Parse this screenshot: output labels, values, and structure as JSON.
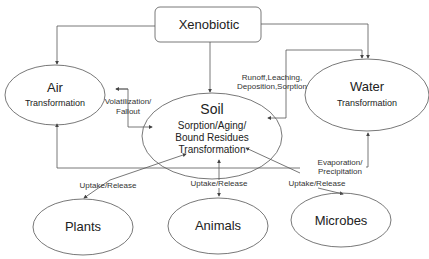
{
  "nodes": {
    "xenobiotic": {
      "label": "Xenobiotic"
    },
    "air": {
      "title": "Air",
      "subtitle": "Transformation"
    },
    "soil": {
      "title": "Soil",
      "line1": "Sorption/Aging/",
      "line2": "Bound Residues",
      "line3": "Transformation"
    },
    "water": {
      "title": "Water",
      "subtitle": "Transformation"
    },
    "plants": {
      "label": "Plants"
    },
    "animals": {
      "label": "Animals"
    },
    "microbes": {
      "label": "Microbes"
    }
  },
  "edges": {
    "volatilization": {
      "line1": "Volatilization/",
      "line2": "Fallout"
    },
    "runoff": {
      "line1": "Runoff,Leaching,",
      "line2": "Deposition,Sorption"
    },
    "evaporation": {
      "line1": "Evaporation/",
      "line2": "Precipitation"
    },
    "uptake_plants": "Uptake/Release",
    "uptake_animals": "Uptake/Release",
    "uptake_microbes": "Uptake/Release"
  },
  "colors": {
    "stroke": "#555555",
    "text": "#222222",
    "background": "#ffffff"
  }
}
